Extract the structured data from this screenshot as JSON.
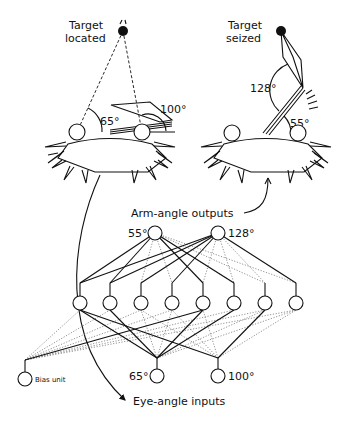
{
  "diagram": {
    "left_panel": {
      "title_line1": "Target",
      "title_line2": "located",
      "eye_angle_left": "65°",
      "eye_angle_right": "100°"
    },
    "right_panel": {
      "title_line1": "Target",
      "title_line2": "seized",
      "elbow_angle": "128°",
      "shoulder_angle": "55°"
    },
    "network": {
      "outputs_label": "Arm-angle outputs",
      "inputs_label": "Eye-angle inputs",
      "output_nodes": [
        {
          "label": "55°"
        },
        {
          "label": "128°"
        }
      ],
      "hidden_node_count": 8,
      "input_nodes": [
        {
          "label": "65°"
        },
        {
          "label": "100°"
        }
      ],
      "bias_label": "Bias unit"
    }
  }
}
